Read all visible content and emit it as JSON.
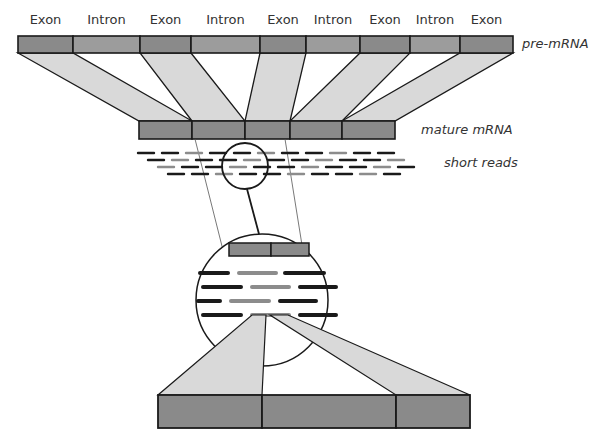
{
  "segment_labels": [
    "Exon",
    "Intron",
    "Exon",
    "Intron",
    "Exon",
    "Intron",
    "Exon",
    "Intron",
    "Exon"
  ],
  "labels": {
    "pre_mrna": "pre-mRNA",
    "mature_mrna": "mature mRNA",
    "short_reads": "short reads"
  },
  "colors": {
    "exon_fill": "#8a8a8a",
    "intron_fill": "#9c9c9c",
    "projection_fill": "#d9d9d9",
    "read_dark": "#1a1a1a",
    "read_gray": "#8c8c8c",
    "outline": "#1a1a1a"
  },
  "pre_mrna": {
    "y": 36,
    "h": 17,
    "boundaries": [
      18,
      73,
      140,
      191,
      260,
      306,
      360,
      410,
      460,
      513
    ]
  },
  "mature_mrna": {
    "y": 121,
    "h": 18,
    "boundaries": [
      139,
      192,
      245,
      290,
      342,
      395
    ]
  },
  "small_circle": {
    "cx": 245,
    "cy": 166,
    "r": 23
  },
  "big_circle": {
    "cx": 262,
    "cy": 300,
    "r": 66
  },
  "bottom_bar": {
    "y": 395,
    "h": 33,
    "boundaries": [
      158,
      262,
      396,
      470
    ]
  }
}
